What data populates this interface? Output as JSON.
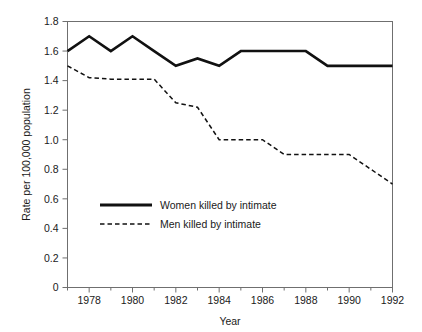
{
  "chart_data": {
    "type": "line",
    "title": "",
    "xlabel": "Year",
    "ylabel": "Rate per 100,000 population",
    "x": [
      1977,
      1978,
      1979,
      1980,
      1981,
      1982,
      1983,
      1984,
      1985,
      1986,
      1987,
      1988,
      1989,
      1990,
      1991,
      1992
    ],
    "xlim": [
      1977,
      1992
    ],
    "ylim": [
      0,
      1.8
    ],
    "grid": false,
    "legend_position": "inside-lower-left",
    "x_tick_labels": [
      "1978",
      "1980",
      "1982",
      "1984",
      "1986",
      "1988",
      "1990",
      "1992"
    ],
    "x_tick_values": [
      1978,
      1980,
      1982,
      1984,
      1986,
      1988,
      1990,
      1992
    ],
    "x_minor_ticks": [
      1977,
      1979,
      1981,
      1983,
      1985,
      1987,
      1989,
      1991
    ],
    "y_tick_labels": [
      "0",
      "0.2",
      "0.4",
      "0.6",
      "0.8",
      "1.0",
      "1.2",
      "1.4",
      "1.6",
      "1.8"
    ],
    "y_tick_values": [
      0,
      0.2,
      0.4,
      0.6,
      0.8,
      1.0,
      1.2,
      1.4,
      1.6,
      1.8
    ],
    "series": [
      {
        "name": "Women killed by intimate",
        "style": "solid",
        "color": "#111111",
        "values": [
          1.6,
          1.7,
          1.6,
          1.7,
          1.6,
          1.5,
          1.55,
          1.5,
          1.6,
          1.6,
          1.6,
          1.6,
          1.5,
          1.5,
          1.5,
          1.5
        ]
      },
      {
        "name": "Men killed by intimate",
        "style": "dashed",
        "color": "#111111",
        "values": [
          1.5,
          1.42,
          1.41,
          1.41,
          1.41,
          1.25,
          1.22,
          1.0,
          1.0,
          1.0,
          0.9,
          0.9,
          0.9,
          0.9,
          0.8,
          0.7
        ]
      }
    ],
    "legend": [
      {
        "label": "Women killed by intimate",
        "style": "solid"
      },
      {
        "label": "Men killed by intimate",
        "style": "dashed"
      }
    ]
  }
}
